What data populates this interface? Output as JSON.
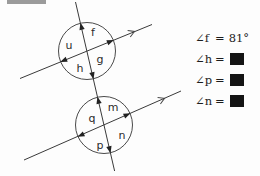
{
  "diagram": {
    "top_intersection": {
      "labels": {
        "u": "u",
        "f": "f",
        "g": "g",
        "h": "h"
      }
    },
    "bottom_intersection": {
      "labels": {
        "q": "q",
        "m": "m",
        "n": "n",
        "p": "p"
      }
    },
    "parallel_marks": 2
  },
  "equations": {
    "rows": [
      {
        "label": "∠f",
        "sign": "=",
        "value": "81°",
        "redacted": false
      },
      {
        "label": "∠h",
        "sign": "=",
        "value": "",
        "redacted": true
      },
      {
        "label": "∠p",
        "sign": "=",
        "value": "",
        "redacted": true
      },
      {
        "label": "∠n",
        "sign": "=",
        "value": "",
        "redacted": true
      }
    ]
  },
  "colors": {
    "line": "#3a3a3a",
    "text": "#1c1c1c",
    "redaction": "#141414",
    "gray_bar": "#9b9b9b"
  }
}
